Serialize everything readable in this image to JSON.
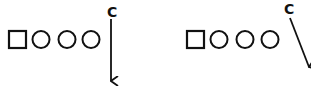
{
  "diagrams": [
    {
      "id": "left",
      "player_label": "C",
      "route": "straight-down",
      "formation": [
        "square",
        "circle",
        "circle",
        "circle"
      ],
      "caption": ""
    },
    {
      "id": "right",
      "player_label": "C",
      "route": "diagonal-down-right",
      "formation": [
        "square",
        "circle",
        "circle",
        "circle"
      ],
      "caption": ""
    }
  ],
  "colors": {
    "ink": "#111111",
    "background": "#ffffff"
  }
}
